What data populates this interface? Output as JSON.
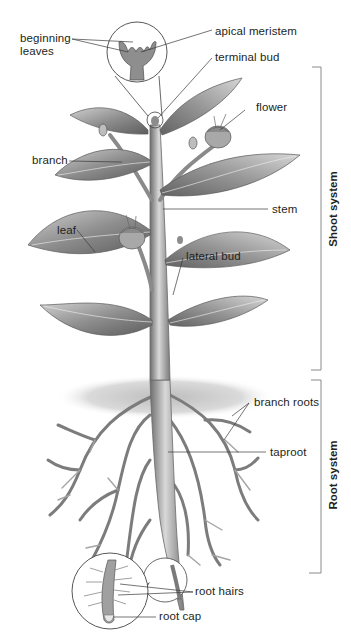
{
  "diagram": {
    "colors": {
      "background": "#ffffff",
      "text": "#231f20",
      "leader_line": "#3a3a3a",
      "bracket": "#8a8a8a",
      "plant_dark": "#5a5a5a",
      "plant_mid": "#9a9a9a",
      "plant_light": "#d4d4d4",
      "soil": "#cfcfcf"
    },
    "labels": {
      "beginning_leaves": [
        "beginning",
        "leaves"
      ],
      "apical_meristem": "apical meristem",
      "terminal_bud": "terminal bud",
      "flower": "flower",
      "branch": "branch",
      "stem": "stem",
      "leaf": "leaf",
      "lateral_bud": "lateral bud",
      "branch_roots": "branch roots",
      "taproot": "taproot",
      "root_hairs": "root hairs",
      "root_cap": "root cap"
    },
    "systems": {
      "shoot": {
        "label": "Shoot system",
        "bracket_top": 67,
        "bracket_bottom": 370
      },
      "root": {
        "label": "Root system",
        "bracket_top": 380,
        "bracket_bottom": 573
      }
    },
    "insets": [
      {
        "name": "apical-meristem-inset",
        "cx": 137,
        "cy": 52,
        "r": 30,
        "detail_of": "terminal bud"
      },
      {
        "name": "root-tip-inset",
        "cx": 110,
        "cy": 591,
        "r": 38,
        "detail_of": "root tip"
      }
    ]
  }
}
